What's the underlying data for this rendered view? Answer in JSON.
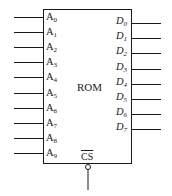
{
  "diagram": {
    "block": {
      "label": "ROM"
    },
    "inputs": [
      {
        "base": "A",
        "sub": "0"
      },
      {
        "base": "A",
        "sub": "1"
      },
      {
        "base": "A",
        "sub": "2"
      },
      {
        "base": "A",
        "sub": "3"
      },
      {
        "base": "A",
        "sub": "4"
      },
      {
        "base": "A",
        "sub": "5"
      },
      {
        "base": "A",
        "sub": "6"
      },
      {
        "base": "A",
        "sub": "7"
      },
      {
        "base": "A",
        "sub": "8"
      },
      {
        "base": "A",
        "sub": "9"
      }
    ],
    "outputs": [
      {
        "base": "D",
        "sub": "0"
      },
      {
        "base": "D",
        "sub": "1"
      },
      {
        "base": "D",
        "sub": "2"
      },
      {
        "base": "D",
        "sub": "3"
      },
      {
        "base": "D",
        "sub": "4"
      },
      {
        "base": "D",
        "sub": "5"
      },
      {
        "base": "D",
        "sub": "6"
      },
      {
        "base": "D",
        "sub": "7"
      }
    ],
    "chip_select": {
      "label": "CS",
      "active_low": true
    },
    "colors": {
      "line": "#1a1a1a",
      "background": "#ffffff"
    }
  }
}
